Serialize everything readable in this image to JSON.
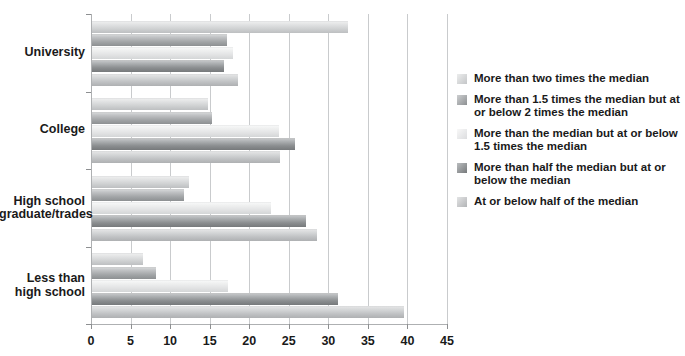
{
  "chart_data": {
    "type": "bar",
    "orientation": "horizontal",
    "title": "",
    "xlabel": "",
    "ylabel": "",
    "xlim": [
      0,
      45
    ],
    "xticks": [
      0,
      5,
      10,
      15,
      20,
      25,
      30,
      35,
      40,
      45
    ],
    "xtick_labels": [
      "0",
      "5",
      "10",
      "15",
      "20",
      "25",
      "30",
      "35",
      "40",
      "45"
    ],
    "grid": true,
    "legend_position": "right",
    "categories": [
      "University",
      "College",
      "High school\ngraduate/trades",
      "Less than\nhigh school"
    ],
    "series": [
      {
        "name": "More than two times the median",
        "color": "#d9dbdc",
        "values": [
          32.3,
          14.6,
          12.2,
          6.5
        ]
      },
      {
        "name": "More than 1.5 times the median but at or below 2 times the median",
        "color": "#a8abad",
        "values": [
          17.1,
          15.2,
          11.6,
          8.1
        ]
      },
      {
        "name": "More than the median but at or below 1.5 times the median",
        "color": "#ebecec",
        "values": [
          17.8,
          23.7,
          22.6,
          17.2
        ]
      },
      {
        "name": "More than half the median but at or below the median",
        "color": "#8e9193",
        "values": [
          16.7,
          25.6,
          27.1,
          31.1
        ]
      },
      {
        "name": "At or below half of the median",
        "color": "#c8cacc",
        "values": [
          18.4,
          23.8,
          28.5,
          39.5
        ]
      }
    ]
  },
  "legend": {
    "items": [
      {
        "label": "More than two times the median",
        "swatch": "legend-swatch-series-1"
      },
      {
        "label": "More than 1.5 times the median but at or below 2 times the median",
        "swatch": "legend-swatch-series-2"
      },
      {
        "label": "More than the median but at or below 1.5 times the median",
        "swatch": "legend-swatch-series-3"
      },
      {
        "label": "More than half the median but at or below the median",
        "swatch": "legend-swatch-series-4"
      },
      {
        "label": "At or below half of the median",
        "swatch": "legend-swatch-series-5"
      }
    ]
  },
  "axis": {
    "x_tick_labels": [
      "0",
      "5",
      "10",
      "15",
      "20",
      "25",
      "30",
      "35",
      "40",
      "45"
    ],
    "y_category_labels": [
      "University",
      "College",
      "High school\ngraduate/trades",
      "Less than\nhigh school"
    ]
  }
}
